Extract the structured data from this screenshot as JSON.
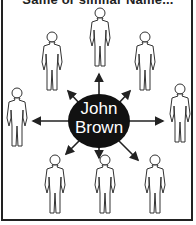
{
  "caption": "Same or similar Name...",
  "center": {
    "line1": "John",
    "line2": "Brown",
    "fill": "#111111",
    "text_color": "#ffffff"
  },
  "people": [
    {
      "id": "top",
      "x": 100,
      "y": 8
    },
    {
      "id": "upper-left",
      "x": 52,
      "y": 32
    },
    {
      "id": "upper-right",
      "x": 145,
      "y": 32
    },
    {
      "id": "left",
      "x": 17,
      "y": 88
    },
    {
      "id": "right",
      "x": 180,
      "y": 84
    },
    {
      "id": "lower-left",
      "x": 55,
      "y": 150
    },
    {
      "id": "lower-center",
      "x": 105,
      "y": 150
    },
    {
      "id": "lower-right",
      "x": 155,
      "y": 150
    }
  ],
  "colors": {
    "line": "#222222",
    "background": "#ffffff"
  }
}
